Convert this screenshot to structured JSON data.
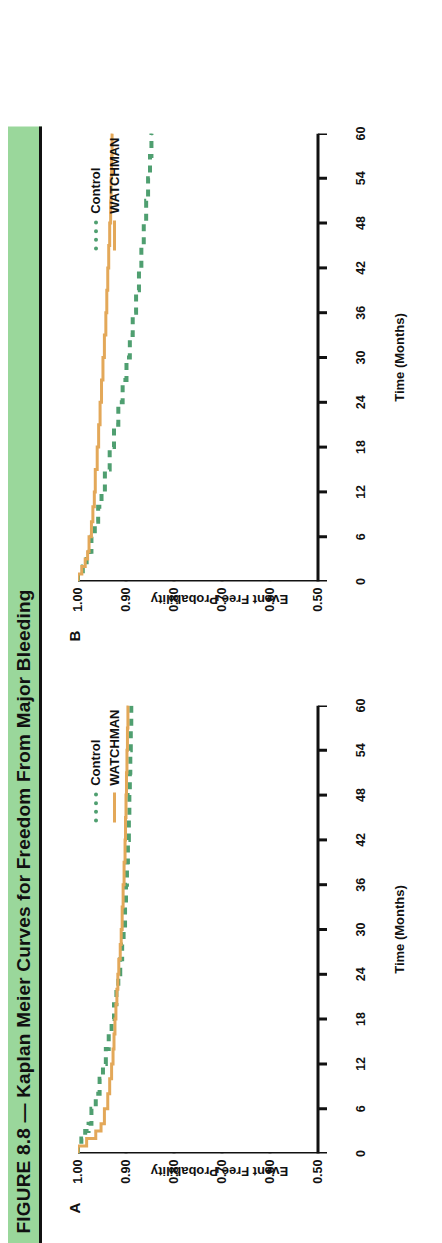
{
  "figure": {
    "banner_title": "FIGURE 8.8 — Kaplan Meier Curves for Freedom From Major Bleeding",
    "banner_color": "#9ad79b",
    "panel_a_letter": "A",
    "panel_b_letter": "B"
  },
  "colors": {
    "control": "#4f9f70",
    "watchman": "#e3a859",
    "axis": "#111111",
    "banner": "#9ad79b"
  },
  "legend": {
    "control_label": "Control",
    "watchman_label": "WATCHMAN"
  },
  "axes": {
    "xlabel": "Time (Months)",
    "ylabel": "Event Free Probability",
    "xticks": [
      "0",
      "6",
      "12",
      "18",
      "24",
      "30",
      "36",
      "42",
      "48",
      "54",
      "60"
    ],
    "yticks": [
      "1.00",
      "0.90",
      "0.80",
      "0.70",
      "0.60",
      "0.50"
    ]
  },
  "chart_data": [
    {
      "type": "line",
      "panel": "A",
      "title": "Kaplan Meier Curves for Freedom From Major Bleeding — Panel A",
      "xlabel": "Time (Months)",
      "ylabel": "Event Free Probability",
      "xlim": [
        0,
        60
      ],
      "ylim": [
        0.5,
        1.0
      ],
      "xticks": [
        0,
        6,
        12,
        18,
        24,
        30,
        36,
        42,
        48,
        54,
        60
      ],
      "yticks": [
        1.0,
        0.9,
        0.8,
        0.7,
        0.6,
        0.5
      ],
      "grid": false,
      "legend_position": "upper right inside",
      "series": [
        {
          "name": "Control",
          "style": "dashed",
          "color": "#4f9f70",
          "x": [
            0,
            1,
            2,
            3,
            4,
            6,
            8,
            10,
            12,
            14,
            16,
            18,
            20,
            22,
            24,
            26,
            28,
            30,
            33,
            36,
            39,
            42,
            45,
            48,
            51,
            54,
            57,
            60
          ],
          "y": [
            1.0,
            0.993,
            0.985,
            0.978,
            0.972,
            0.963,
            0.955,
            0.948,
            0.942,
            0.936,
            0.93,
            0.925,
            0.92,
            0.916,
            0.912,
            0.908,
            0.905,
            0.902,
            0.9,
            0.898,
            0.896,
            0.894,
            0.893,
            0.892,
            0.891,
            0.89,
            0.889,
            0.888
          ]
        },
        {
          "name": "WATCHMAN",
          "style": "solid",
          "color": "#e3a859",
          "x": [
            0,
            1,
            2,
            3,
            4,
            6,
            8,
            10,
            12,
            14,
            16,
            18,
            20,
            22,
            24,
            26,
            28,
            30,
            33,
            36,
            39,
            42,
            45,
            48,
            51,
            54,
            57,
            60
          ],
          "y": [
            1.0,
            0.982,
            0.963,
            0.952,
            0.945,
            0.938,
            0.934,
            0.93,
            0.927,
            0.925,
            0.923,
            0.921,
            0.919,
            0.917,
            0.915,
            0.912,
            0.91,
            0.908,
            0.906,
            0.904,
            0.902,
            0.901,
            0.9,
            0.899,
            0.898,
            0.897,
            0.896,
            0.895
          ]
        }
      ]
    },
    {
      "type": "line",
      "panel": "B",
      "title": "Kaplan Meier Curves for Freedom From Major Bleeding — Panel B",
      "xlabel": "Time (Months)",
      "ylabel": "Event Free Probability",
      "xlim": [
        0,
        60
      ],
      "ylim": [
        0.5,
        1.0
      ],
      "xticks": [
        0,
        6,
        12,
        18,
        24,
        30,
        36,
        42,
        48,
        54,
        60
      ],
      "yticks": [
        1.0,
        0.9,
        0.8,
        0.7,
        0.6,
        0.5
      ],
      "grid": false,
      "legend_position": "upper right inside",
      "series": [
        {
          "name": "Control",
          "style": "dashed",
          "color": "#4f9f70",
          "x": [
            0,
            1,
            2,
            3,
            4,
            6,
            8,
            10,
            12,
            15,
            18,
            21,
            24,
            27,
            30,
            33,
            36,
            39,
            42,
            45,
            48,
            51,
            54,
            57,
            60
          ],
          "y": [
            1.0,
            0.99,
            0.982,
            0.976,
            0.972,
            0.965,
            0.958,
            0.951,
            0.944,
            0.934,
            0.925,
            0.916,
            0.907,
            0.899,
            0.892,
            0.886,
            0.879,
            0.873,
            0.868,
            0.863,
            0.858,
            0.854,
            0.85,
            0.847,
            0.845
          ]
        },
        {
          "name": "WATCHMAN",
          "style": "solid",
          "color": "#e3a859",
          "x": [
            0,
            1,
            2,
            3,
            4,
            6,
            8,
            10,
            12,
            15,
            18,
            21,
            24,
            27,
            30,
            33,
            36,
            39,
            42,
            45,
            48,
            51,
            54,
            57,
            60
          ],
          "y": [
            1.0,
            0.992,
            0.985,
            0.98,
            0.977,
            0.972,
            0.969,
            0.966,
            0.964,
            0.96,
            0.957,
            0.954,
            0.951,
            0.948,
            0.945,
            0.942,
            0.94,
            0.938,
            0.936,
            0.934,
            0.932,
            0.931,
            0.93,
            0.929,
            0.928
          ]
        }
      ]
    }
  ]
}
